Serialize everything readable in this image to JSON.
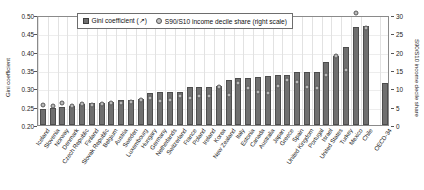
{
  "axes": {
    "left_title": "Gini coefficient",
    "right_title": "S90/S10 income decile share",
    "left_ticks": [
      "0.50",
      "0.45",
      "0.40",
      "0.35",
      "0.30",
      "0.25",
      "0.20"
    ],
    "right_ticks": [
      "30",
      "25",
      "20",
      "15",
      "10",
      "5",
      "0"
    ]
  },
  "legend": {
    "gini_label": "Gini coefficient (↗)",
    "s90s10_label": "S90/S10 income decile share (right scale)",
    "gini_marker": "square-marker-icon",
    "s90s10_marker": "circle-marker-icon"
  },
  "chart_data": {
    "type": "bar",
    "title": "",
    "xlabel": "",
    "ylabel": "Gini coefficient",
    "ylabel_right": "S90/S10 income decile share",
    "ylim": [
      0.2,
      0.5
    ],
    "ylim_right": [
      0,
      30
    ],
    "grid": true,
    "legend_position": "top-center",
    "categories": [
      "Iceland",
      "Slovenia",
      "Norway",
      "Denmark",
      "Czech Republic",
      "Finland",
      "Slovak Republic",
      "Belgium",
      "Austria",
      "Sweden",
      "Luxembourg",
      "Hungary",
      "Germany",
      "Netherlands",
      "Switzerland",
      "France",
      "Poland",
      "Ireland",
      "Korea",
      "New Zealand",
      "Italy",
      "Estonia",
      "Canada",
      "Australia",
      "Japan",
      "Greece",
      "Spain",
      "United Kingdom",
      "Portugal",
      "Israel",
      "United States",
      "Turkey",
      "Mexico",
      "Chile",
      "OECD-34"
    ],
    "series": [
      {
        "name": "Gini coefficient (↗)",
        "type": "bar",
        "axis": "left",
        "values": [
          0.244,
          0.246,
          0.25,
          0.253,
          0.256,
          0.26,
          0.261,
          0.262,
          0.267,
          0.269,
          0.272,
          0.288,
          0.289,
          0.289,
          0.29,
          0.303,
          0.304,
          0.304,
          0.307,
          0.323,
          0.327,
          0.329,
          0.332,
          0.334,
          0.336,
          0.337,
          0.344,
          0.344,
          0.345,
          0.371,
          0.389,
          0.412,
          0.466,
          0.47,
          0.315
        ]
      },
      {
        "name": "S90/S10 income decile share (right scale)",
        "type": "scatter",
        "axis": "right",
        "values": [
          5.4,
          5.3,
          6.1,
          5.3,
          5.6,
          5.5,
          5.6,
          5.9,
          6.0,
          6.2,
          6.9,
          7.3,
          6.6,
          6.8,
          7.9,
          7.4,
          8.0,
          8.0,
          10.5,
          8.1,
          11.4,
          10.0,
          8.9,
          8.8,
          10.7,
          12.3,
          11.7,
          10.5,
          10.0,
          13.6,
          18.8,
          14.9,
          30.5,
          26.5,
          9.6
        ]
      }
    ]
  }
}
